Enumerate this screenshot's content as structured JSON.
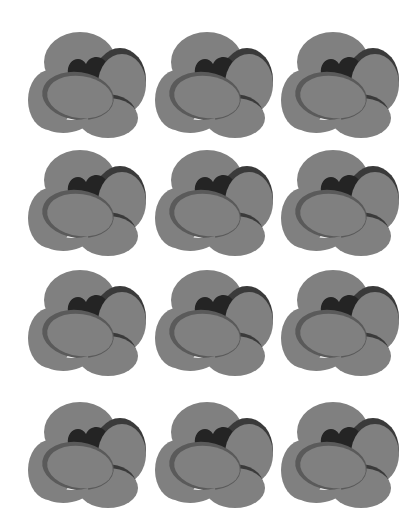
{
  "page": {
    "title": "",
    "background": "#ffffff"
  },
  "colors": {
    "petal": "#808080",
    "petal_edge": "#5a5a5a",
    "shadow": "#3a3a3a",
    "center": "#242424"
  },
  "grid": {
    "columns": 3,
    "rows": 4,
    "column_x": [
      28,
      155,
      281
    ],
    "row_y": [
      28,
      146,
      266,
      398
    ]
  },
  "flowers": [
    {
      "icon": "flower-icon",
      "row": 0,
      "col": 0
    },
    {
      "icon": "flower-icon",
      "row": 0,
      "col": 1
    },
    {
      "icon": "flower-icon",
      "row": 0,
      "col": 2
    },
    {
      "icon": "flower-icon",
      "row": 1,
      "col": 0
    },
    {
      "icon": "flower-icon",
      "row": 1,
      "col": 1
    },
    {
      "icon": "flower-icon",
      "row": 1,
      "col": 2
    },
    {
      "icon": "flower-icon",
      "row": 2,
      "col": 0
    },
    {
      "icon": "flower-icon",
      "row": 2,
      "col": 1
    },
    {
      "icon": "flower-icon",
      "row": 2,
      "col": 2
    },
    {
      "icon": "flower-icon",
      "row": 3,
      "col": 0
    },
    {
      "icon": "flower-icon",
      "row": 3,
      "col": 1
    },
    {
      "icon": "flower-icon",
      "row": 3,
      "col": 2
    }
  ]
}
